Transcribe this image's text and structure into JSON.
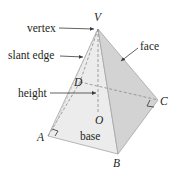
{
  "labels": {
    "vertex": "vertex",
    "slant_edge": "slant edge",
    "face": "face",
    "height": "height",
    "base": "base"
  },
  "points": {
    "V": "V",
    "A": "A",
    "B": "B",
    "C": "C",
    "D": "D",
    "O": "O"
  },
  "colors": {
    "front_face": "#ececec",
    "right_face": "#d2d2d2",
    "edge": "#9a9a9a",
    "hidden_edge": "#8a8a8a",
    "text": "#231f20",
    "arrow": "#3a3a3a"
  }
}
